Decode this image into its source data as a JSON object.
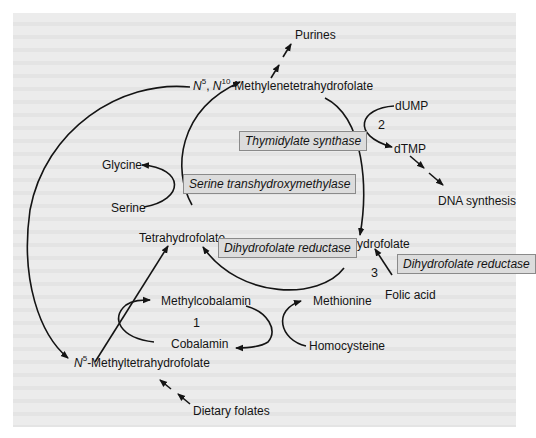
{
  "diagram": {
    "nodes": {
      "methylene_thf": {
        "prefix_n": "N",
        "sup1": "5",
        "comma": ", ",
        "n2": "N",
        "sup2": "10",
        "rest": "-Methylenetetrahydrofolate"
      },
      "purines": "Purines",
      "dump": "dUMP",
      "dtmp": "dTMP",
      "dna_synthesis": "DNA synthesis",
      "glycine": "Glycine",
      "serine": "Serine",
      "tetrahydrofolate": "Tetrahydrofolate",
      "dihydrofolate": "Dihydrofolate",
      "folic_acid": "Folic acid",
      "methylcobalamin": "Methylcobalamin",
      "cobalamin": "Cobalamin",
      "methionine": "Methionine",
      "homocysteine": "Homocysteine",
      "methyl_thf": {
        "n": "N",
        "sup": "5",
        "rest": "-Methyltetrahydrofolate"
      },
      "dietary_folates": "Dietary folates"
    },
    "enzymes": {
      "thymidylate_synthase": "Thymidylate synthase",
      "serine_transhydroxymethylase": "Serine transhydroxymethylase",
      "dhfr_inner": "Dihydrofolate reductase",
      "dhfr_outer": "Dihydrofolate reductase"
    },
    "step_numbers": {
      "one": "1",
      "two": "2",
      "three": "3"
    },
    "colors": {
      "panel": "#ececec",
      "enzyme_box": "#dcdcdc",
      "enzyme_border": "#8a8a8a",
      "line": "#141414"
    }
  }
}
